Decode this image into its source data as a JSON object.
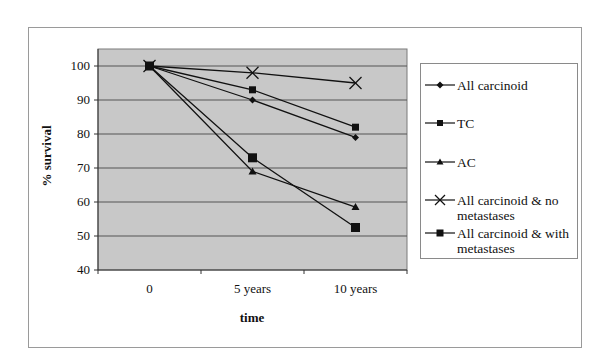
{
  "chart_data": {
    "type": "line",
    "title": "",
    "xlabel": "time",
    "ylabel": "% survival",
    "categories": [
      "0",
      "5 years",
      "10 years"
    ],
    "ylim": [
      40,
      100
    ],
    "yticks": [
      "100",
      "90",
      "80",
      "70",
      "60",
      "50",
      "40"
    ],
    "grid": true,
    "legend_position": "right",
    "series": [
      {
        "name": "All carcinoid",
        "marker": "diamond",
        "values": [
          100,
          90,
          79
        ]
      },
      {
        "name": "TC",
        "marker": "square",
        "values": [
          100,
          93,
          82
        ]
      },
      {
        "name": "AC",
        "marker": "triangle",
        "values": [
          100,
          69,
          58.5
        ]
      },
      {
        "name": "All carcinoid & no metastases",
        "marker": "x",
        "values": [
          100,
          98,
          95
        ]
      },
      {
        "name": "All carcinoid & with metastases",
        "marker": "square",
        "values": [
          100,
          73,
          52.5
        ]
      }
    ]
  },
  "legend": {
    "items": [
      {
        "label_line1": "All carcinoid",
        "label_line2": ""
      },
      {
        "label_line1": "TC",
        "label_line2": ""
      },
      {
        "label_line1": "AC",
        "label_line2": ""
      },
      {
        "label_line1": "All carcinoid & no",
        "label_line2": "metastases"
      },
      {
        "label_line1": "All carcinoid & with",
        "label_line2": "metastases"
      }
    ]
  },
  "colors": {
    "plot_background": "#c8c8c8",
    "gridline": "#555555",
    "series_line": "#111111"
  }
}
